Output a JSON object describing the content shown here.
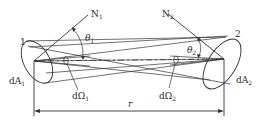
{
  "diagram": {
    "type": "radiation-exchange-between-two-differential-areas",
    "surfaces": [
      {
        "id": "1",
        "label": "1",
        "area_label": "dA",
        "area_sub": "1",
        "normal_label": "N",
        "normal_sub": "1",
        "angle_label": "θ",
        "angle_sub": "1",
        "solid_angle_label": "dΩ",
        "solid_angle_sub": "1"
      },
      {
        "id": "2",
        "label": "2",
        "area_label": "dA",
        "area_sub": "2",
        "normal_label": "N",
        "normal_sub": "2",
        "angle_label": "θ",
        "angle_sub": "2",
        "solid_angle_label": "dΩ",
        "solid_angle_sub": "2"
      }
    ],
    "distance_label": "r",
    "colors": {
      "line": "#333333",
      "text": "#2a2a2a",
      "background": "#ffffff"
    }
  }
}
